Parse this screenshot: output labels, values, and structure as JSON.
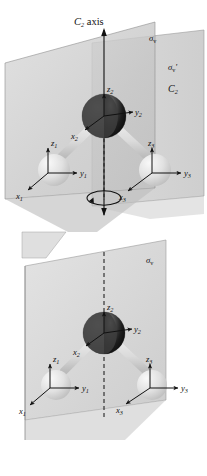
{
  "figure": {
    "panels": [
      {
        "id": "top",
        "name": "c2v-full-symmetry-panel",
        "labels": {
          "axis_label": "C",
          "axis_label_sub": "2",
          "axis_label_word": " axis",
          "sigma_v": "σ",
          "sigma_v_sub": "v",
          "sigma_v_prime": "σ",
          "sigma_v_prime_sub": "v",
          "sigma_v_prime_mark": "'",
          "c2_label": "C",
          "c2_label_sub": "2"
        },
        "atoms": [
          {
            "name": "oxygen-atom",
            "element": "O",
            "axes": [
              "z2",
              "y2",
              "x2"
            ]
          },
          {
            "name": "hydrogen-atom-left",
            "element": "H",
            "axes": [
              "z1",
              "y1",
              "x1"
            ]
          },
          {
            "name": "hydrogen-atom-right",
            "element": "H",
            "axes": [
              "z3",
              "y3",
              "x3"
            ]
          }
        ],
        "axis_labels": [
          {
            "letter": "z",
            "sub": "2"
          },
          {
            "letter": "y",
            "sub": "2"
          },
          {
            "letter": "x",
            "sub": "2"
          },
          {
            "letter": "z",
            "sub": "1"
          },
          {
            "letter": "y",
            "sub": "1"
          },
          {
            "letter": "x",
            "sub": "1"
          },
          {
            "letter": "z",
            "sub": "3"
          },
          {
            "letter": "y",
            "sub": "3"
          },
          {
            "letter": "x",
            "sub": "3"
          }
        ],
        "has_rotation_arrow": true,
        "planes": 2
      },
      {
        "id": "bottom",
        "name": "single-mirror-plane-panel",
        "labels": {
          "sigma_v": "σ",
          "sigma_v_sub": "v"
        },
        "atoms": [
          {
            "name": "oxygen-atom",
            "element": "O",
            "axes": [
              "z2",
              "y2",
              "x2"
            ]
          },
          {
            "name": "hydrogen-atom-left",
            "element": "H",
            "axes": [
              "z1",
              "y1",
              "x1"
            ]
          },
          {
            "name": "hydrogen-atom-right",
            "element": "H",
            "axes": [
              "z3",
              "y3",
              "x3"
            ]
          }
        ],
        "axis_labels": [
          {
            "letter": "z",
            "sub": "2"
          },
          {
            "letter": "y",
            "sub": "2"
          },
          {
            "letter": "x",
            "sub": "2"
          },
          {
            "letter": "z",
            "sub": "1"
          },
          {
            "letter": "y",
            "sub": "1"
          },
          {
            "letter": "x",
            "sub": "1"
          },
          {
            "letter": "z",
            "sub": "3"
          },
          {
            "letter": "y",
            "sub": "3"
          },
          {
            "letter": "x",
            "sub": "3"
          }
        ],
        "has_rotation_arrow": false,
        "planes": 1
      }
    ],
    "colors": {
      "plane_fill": "#c9c9c9",
      "plane_fill_light": "#d6d6d6",
      "plane_edge": "#8a8a8a",
      "oxygen_dark": "#171717",
      "oxygen_mid": "#3a3a3a",
      "hydrogen_light": "#dcdcdc",
      "bond": "#e6e6e6",
      "line": "#111111",
      "background": "#ffffff"
    }
  }
}
